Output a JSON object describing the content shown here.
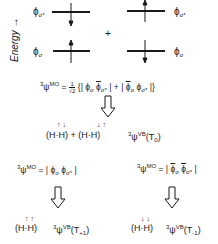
{
  "axis": {
    "label": "Energy",
    "arrow": "→"
  },
  "orbitals": {
    "upper": {
      "symbol": "ϕ",
      "sub": "σ*"
    },
    "lower": {
      "symbol": "ϕ",
      "sub": "σ"
    }
  },
  "config_left": {
    "upper_spin": "down",
    "lower_spin": "up"
  },
  "config_right": {
    "upper_spin": "up",
    "lower_spin": "down"
  },
  "plus": "+",
  "eq_T0": {
    "prefix_sup": "3",
    "psi": "ψ",
    "psi_sup": "MO",
    "equals": "=",
    "frac_num": "1",
    "frac_den": "√2",
    "body_open": "{|",
    "term1_a": "ϕ",
    "term1_a_sub": "σ",
    "term1_b": "ϕ",
    "term1_b_sub": "σ*",
    "mid": "| + |",
    "term2_a": "ϕ",
    "term2_a_sub": "σ",
    "term2_b": "ϕ",
    "term2_b_sub": "σ*",
    "body_close": "|}"
  },
  "vb_T0": {
    "left_paren": "(H",
    "right_part": "·H)",
    "plus": "+",
    "spins1": "↑ ↓",
    "spins2": "↓ ↑",
    "label_sup": "3",
    "psi": "ψ",
    "psi_sup": "VB",
    "state": "(T",
    "state_sub": "0",
    "state_close": ")"
  },
  "eq_Tp1": {
    "prefix_sup": "3",
    "psi": "ψ",
    "psi_sup": "MO",
    "equals": "= |",
    "a": "ϕ",
    "a_sub": "σ",
    "b": "ϕ",
    "b_sub": "σ*",
    "close": "|"
  },
  "eq_Tm1": {
    "prefix_sup": "3",
    "psi": "ψ",
    "psi_sup": "MO",
    "equals": "= |",
    "a": "ϕ",
    "a_sub": "σ",
    "b": "ϕ",
    "b_sub": "σ*",
    "close": "|"
  },
  "vb_Tp1": {
    "left_paren": "(H",
    "right_part": "·H)",
    "spins": "↑ ↑",
    "label_sup": "3",
    "psi": "ψ",
    "psi_sup": "VB",
    "state": "(T",
    "state_sub": "+1",
    "state_close": ")"
  },
  "vb_Tm1": {
    "left_paren": "(H",
    "right_part": "·H)",
    "spins": "↓ ↓",
    "label_sup": "3",
    "psi": "ψ",
    "psi_sup": "VB",
    "state": "(T",
    "state_sub": "-1",
    "state_close": ")"
  }
}
